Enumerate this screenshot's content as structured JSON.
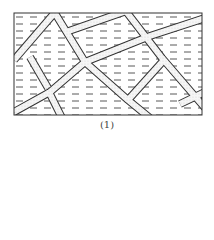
{
  "figure": {
    "caption": "(1)",
    "colors": {
      "line": "#333333",
      "vein_fill": "#f4f4f4",
      "stipple": "#888888",
      "dash": "#444444"
    },
    "frame": {
      "x": 14,
      "y": 13,
      "width": 188,
      "height": 102
    }
  }
}
